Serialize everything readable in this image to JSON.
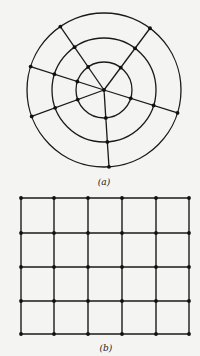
{
  "colors": {
    "background": "#f4f4f2",
    "stroke": "#1a1a1a",
    "node": "#111111"
  },
  "figure_a": {
    "label": "(a)",
    "label_pos": [
      104,
      182
    ],
    "type": "polar-grid-graph",
    "center": [
      104,
      90
    ],
    "ring_radii": [
      28,
      52,
      77
    ],
    "spoke_angles_deg": [
      -124.5,
      -53.3,
      -162.3,
      17.3,
      159.9,
      86.3
    ],
    "node_radius": 1.9,
    "center_node": true
  },
  "figure_b": {
    "label": "(b)",
    "label_pos": [
      106,
      348
    ],
    "type": "rectangular-grid-graph",
    "columns_x": [
      21,
      54,
      88,
      122,
      156,
      189
    ],
    "rows_y": [
      198,
      233,
      267,
      301,
      334
    ],
    "node_radius": 1.9
  }
}
